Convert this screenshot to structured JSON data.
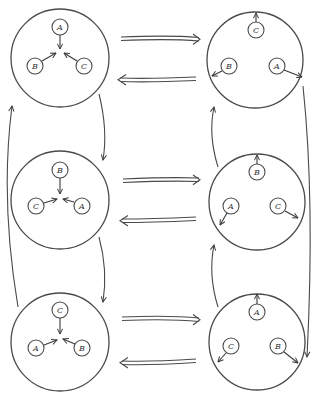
{
  "diagram": {
    "type": "state-transition",
    "colors": {
      "stroke": "#4a4a4a",
      "background": "#ffffff"
    },
    "states": [
      {
        "id": "top-left",
        "center": [
          60,
          58
        ],
        "radius": 49,
        "nodes": [
          {
            "label": "A",
            "pos": [
              60,
              27
            ],
            "arrow": "inward"
          },
          {
            "label": "B",
            "pos": [
              35,
              66
            ],
            "arrow": "inward"
          },
          {
            "label": "C",
            "pos": [
              84,
              66
            ],
            "arrow": "inward"
          }
        ]
      },
      {
        "id": "top-right",
        "center": [
          255,
          60
        ],
        "radius": 48,
        "nodes": [
          {
            "label": "C",
            "pos": [
              256,
              30
            ],
            "arrow": "outward"
          },
          {
            "label": "B",
            "pos": [
              229,
              66
            ],
            "arrow": "outward"
          },
          {
            "label": "A",
            "pos": [
              276,
              66
            ],
            "arrow": "outward"
          }
        ]
      },
      {
        "id": "middle-left",
        "center": [
          60,
          200
        ],
        "radius": 49,
        "nodes": [
          {
            "label": "B",
            "pos": [
              60,
              170
            ],
            "arrow": "inward"
          },
          {
            "label": "C",
            "pos": [
              36,
              206
            ],
            "arrow": "inward"
          },
          {
            "label": "A",
            "pos": [
              82,
              206
            ],
            "arrow": "inward"
          }
        ]
      },
      {
        "id": "middle-right",
        "center": [
          257,
          202
        ],
        "radius": 48,
        "nodes": [
          {
            "label": "B",
            "pos": [
              257,
              172
            ],
            "arrow": "outward"
          },
          {
            "label": "A",
            "pos": [
              231,
              206
            ],
            "arrow": "outward"
          },
          {
            "label": "C",
            "pos": [
              278,
              206
            ],
            "arrow": "outward"
          }
        ]
      },
      {
        "id": "bottom-left",
        "center": [
          60,
          342
        ],
        "radius": 49,
        "nodes": [
          {
            "label": "C",
            "pos": [
              60,
              310
            ],
            "arrow": "inward"
          },
          {
            "label": "A",
            "pos": [
              36,
              348
            ],
            "arrow": "inward"
          },
          {
            "label": "B",
            "pos": [
              82,
              348
            ],
            "arrow": "inward"
          }
        ]
      },
      {
        "id": "bottom-right",
        "center": [
          257,
          342
        ],
        "radius": 48,
        "nodes": [
          {
            "label": "A",
            "pos": [
              257,
              312
            ],
            "arrow": "outward"
          },
          {
            "label": "C",
            "pos": [
              231,
              346
            ],
            "arrow": "outward"
          },
          {
            "label": "B",
            "pos": [
              278,
              346
            ],
            "arrow": "outward"
          }
        ]
      }
    ],
    "transitions": [
      {
        "from": "top-left",
        "to": "top-right",
        "style": "double-arrow"
      },
      {
        "from": "top-right",
        "to": "top-left",
        "style": "double-arrow"
      },
      {
        "from": "middle-left",
        "to": "middle-right",
        "style": "double-arrow"
      },
      {
        "from": "middle-right",
        "to": "middle-left",
        "style": "double-arrow"
      },
      {
        "from": "bottom-left",
        "to": "bottom-right",
        "style": "double-arrow"
      },
      {
        "from": "bottom-right",
        "to": "bottom-left",
        "style": "double-arrow"
      },
      {
        "from": "top-left",
        "to": "middle-left",
        "style": "curved-arrow"
      },
      {
        "from": "middle-left",
        "to": "bottom-left",
        "style": "curved-arrow"
      },
      {
        "from": "bottom-left",
        "to": "top-left",
        "style": "curved-arrow"
      },
      {
        "from": "top-right",
        "to": "bottom-right",
        "style": "curved-arrow"
      },
      {
        "from": "bottom-right",
        "to": "middle-right",
        "style": "curved-arrow"
      },
      {
        "from": "middle-right",
        "to": "top-right",
        "style": "curved-arrow"
      }
    ]
  }
}
